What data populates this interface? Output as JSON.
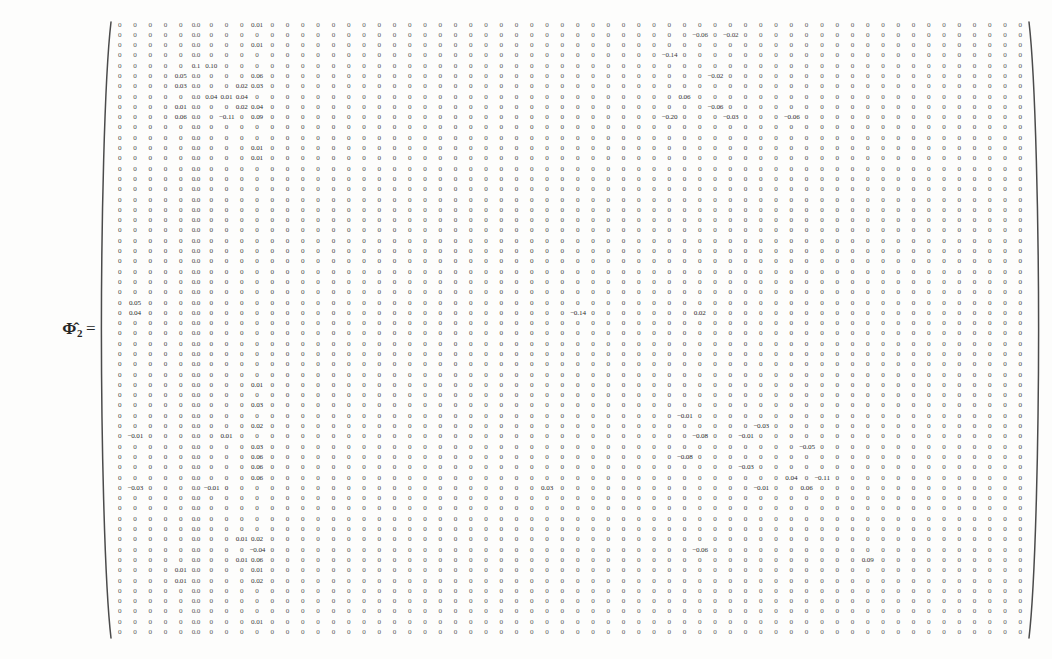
{
  "document": {
    "kind": "scanned-equation",
    "background_color": "#fdfdfc",
    "text_color": "#3a3a3a"
  },
  "equation": {
    "label_symbol": "Φ̂",
    "label_subscript": "2",
    "equals_sign": "=",
    "label_full": "Φ̂₂ ="
  },
  "matrix": {
    "name": "Phi-hat-2",
    "rows": 60,
    "cols": 60,
    "bracket_style": "round-paren",
    "zero_label": "0",
    "zero_padded_label": "0.0",
    "nonzero_values": [
      {
        "row": 0,
        "col": 9,
        "value": "0.01"
      },
      {
        "row": 1,
        "col": 38,
        "value": "−0.06"
      },
      {
        "row": 1,
        "col": 40,
        "value": "−0.02"
      },
      {
        "row": 2,
        "col": 9,
        "value": "0.01"
      },
      {
        "row": 3,
        "col": 36,
        "value": "−0.14"
      },
      {
        "row": 4,
        "col": 5,
        "value": "0.1"
      },
      {
        "row": 4,
        "col": 6,
        "value": "0.10"
      },
      {
        "row": 5,
        "col": 4,
        "value": "0.05"
      },
      {
        "row": 5,
        "col": 9,
        "value": "0.06"
      },
      {
        "row": 5,
        "col": 39,
        "value": "−0.02"
      },
      {
        "row": 6,
        "col": 4,
        "value": "0.03"
      },
      {
        "row": 6,
        "col": 8,
        "value": "0.02"
      },
      {
        "row": 6,
        "col": 9,
        "value": "0.03"
      },
      {
        "row": 7,
        "col": 6,
        "value": "0.04"
      },
      {
        "row": 7,
        "col": 7,
        "value": "0.01"
      },
      {
        "row": 7,
        "col": 8,
        "value": "0.04"
      },
      {
        "row": 7,
        "col": 37,
        "value": "0.06"
      },
      {
        "row": 8,
        "col": 4,
        "value": "0.01"
      },
      {
        "row": 8,
        "col": 8,
        "value": "0.02"
      },
      {
        "row": 8,
        "col": 9,
        "value": "0.04"
      },
      {
        "row": 8,
        "col": 39,
        "value": "−0.06"
      },
      {
        "row": 9,
        "col": 4,
        "value": "0.06"
      },
      {
        "row": 9,
        "col": 7,
        "value": "−0.11"
      },
      {
        "row": 9,
        "col": 9,
        "value": "0.09"
      },
      {
        "row": 9,
        "col": 36,
        "value": "−0.20"
      },
      {
        "row": 9,
        "col": 40,
        "value": "−0.03"
      },
      {
        "row": 9,
        "col": 44,
        "value": "−0.06"
      },
      {
        "row": 12,
        "col": 9,
        "value": "0.01"
      },
      {
        "row": 13,
        "col": 9,
        "value": "0.01"
      },
      {
        "row": 27,
        "col": 1,
        "value": "0.05"
      },
      {
        "row": 28,
        "col": 1,
        "value": "0.04"
      },
      {
        "row": 28,
        "col": 30,
        "value": "−0.14"
      },
      {
        "row": 28,
        "col": 38,
        "value": "0.02"
      },
      {
        "row": 35,
        "col": 9,
        "value": "0.01"
      },
      {
        "row": 37,
        "col": 9,
        "value": "0.03"
      },
      {
        "row": 38,
        "col": 37,
        "value": "−0.01"
      },
      {
        "row": 39,
        "col": 9,
        "value": "0.02"
      },
      {
        "row": 39,
        "col": 42,
        "value": "−0.03"
      },
      {
        "row": 40,
        "col": 1,
        "value": "−0.01"
      },
      {
        "row": 40,
        "col": 7,
        "value": "0.01"
      },
      {
        "row": 40,
        "col": 38,
        "value": "−0.08"
      },
      {
        "row": 40,
        "col": 41,
        "value": "−0.01"
      },
      {
        "row": 41,
        "col": 9,
        "value": "0.03"
      },
      {
        "row": 41,
        "col": 45,
        "value": "−0.05"
      },
      {
        "row": 42,
        "col": 9,
        "value": "0.06"
      },
      {
        "row": 42,
        "col": 37,
        "value": "−0.08"
      },
      {
        "row": 43,
        "col": 9,
        "value": "0.06"
      },
      {
        "row": 43,
        "col": 41,
        "value": "−0.03"
      },
      {
        "row": 44,
        "col": 9,
        "value": "0.06"
      },
      {
        "row": 44,
        "col": 44,
        "value": "0.04"
      },
      {
        "row": 44,
        "col": 46,
        "value": "−0.11"
      },
      {
        "row": 45,
        "col": 1,
        "value": "−0.03"
      },
      {
        "row": 45,
        "col": 6,
        "value": "−0.01"
      },
      {
        "row": 45,
        "col": 7,
        "value": "0"
      },
      {
        "row": 45,
        "col": 28,
        "value": "0.03"
      },
      {
        "row": 45,
        "col": 42,
        "value": "−0.01"
      },
      {
        "row": 45,
        "col": 45,
        "value": "0.06"
      },
      {
        "row": 50,
        "col": 8,
        "value": "0.01"
      },
      {
        "row": 50,
        "col": 9,
        "value": "0.02"
      },
      {
        "row": 51,
        "col": 9,
        "value": "−0.04"
      },
      {
        "row": 51,
        "col": 38,
        "value": "−0.06"
      },
      {
        "row": 52,
        "col": 8,
        "value": "0.01"
      },
      {
        "row": 52,
        "col": 9,
        "value": "0.06"
      },
      {
        "row": 52,
        "col": 49,
        "value": "0.09"
      },
      {
        "row": 53,
        "col": 4,
        "value": "0.01"
      },
      {
        "row": 53,
        "col": 9,
        "value": "0.01"
      },
      {
        "row": 54,
        "col": 4,
        "value": "0.01"
      },
      {
        "row": 54,
        "col": 9,
        "value": "0.02"
      },
      {
        "row": 58,
        "col": 9,
        "value": "0.01"
      }
    ],
    "padded_zero_columns": [
      5
    ],
    "note": "All cells not listed in nonzero_values are zero."
  }
}
